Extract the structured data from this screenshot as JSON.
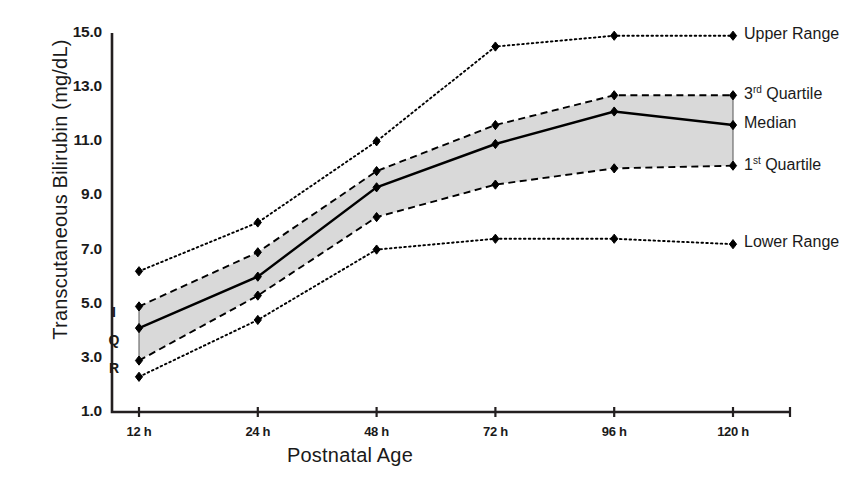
{
  "chart_data": {
    "type": "line",
    "title": "",
    "xlabel": "Postnatal Age",
    "ylabel": "Transcutaneous Bilirubin (mg/dL)",
    "categories": [
      "12 h",
      "24 h",
      "48 h",
      "72 h",
      "96 h",
      "120 h"
    ],
    "x_positions_h": [
      12,
      24,
      48,
      72,
      96,
      120
    ],
    "ylim": [
      1.0,
      15.0
    ],
    "yticks": [
      "1.0",
      "3.0",
      "5.0",
      "7.0",
      "9.0",
      "11.0",
      "13.0",
      "15.0"
    ],
    "ytick_values": [
      1.0,
      3.0,
      5.0,
      7.0,
      9.0,
      11.0,
      13.0,
      15.0
    ],
    "grid": false,
    "legend_position": "right",
    "shaded_band": {
      "label": "IQR",
      "letters": [
        "I",
        "Q",
        "R"
      ],
      "between": [
        "1st Quartile",
        "3rd Quartile"
      ],
      "fill": "#d9d9d9"
    },
    "series": [
      {
        "name": "Upper Range",
        "style": "dotted",
        "marker": "diamond",
        "color": "#000000",
        "values": [
          6.2,
          8.0,
          11.0,
          14.5,
          14.9,
          14.9
        ]
      },
      {
        "name": "3rd Quartile",
        "style": "dashed",
        "marker": "diamond",
        "color": "#000000",
        "values": [
          4.9,
          6.9,
          9.9,
          11.6,
          12.7,
          12.7
        ]
      },
      {
        "name": "Median",
        "style": "solid",
        "marker": "diamond",
        "color": "#000000",
        "values": [
          4.1,
          6.0,
          9.3,
          10.9,
          12.1,
          11.6
        ]
      },
      {
        "name": "1st Quartile",
        "style": "dashed",
        "marker": "diamond",
        "color": "#000000",
        "values": [
          2.9,
          5.3,
          8.2,
          9.4,
          10.0,
          10.1
        ]
      },
      {
        "name": "Lower Range",
        "style": "dotted",
        "marker": "diamond",
        "color": "#000000",
        "values": [
          2.3,
          4.4,
          7.0,
          7.4,
          7.4,
          7.2
        ]
      }
    ]
  },
  "legend": [
    {
      "label_pre": "Upper Range",
      "sup": "",
      "label_post": ""
    },
    {
      "label_pre": "3",
      "sup": "rd",
      "label_post": " Quartile"
    },
    {
      "label_pre": "Median",
      "sup": "",
      "label_post": ""
    },
    {
      "label_pre": "1",
      "sup": "st",
      "label_post": " Quartile"
    },
    {
      "label_pre": "Lower Range",
      "sup": "",
      "label_post": ""
    }
  ]
}
